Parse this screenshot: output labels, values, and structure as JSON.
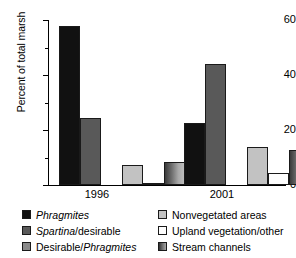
{
  "chart_data": {
    "type": "bar",
    "title": "",
    "xlabel": "",
    "ylabel": "Percent of total marsh",
    "ylim": [
      0,
      60
    ],
    "yticks": [
      0,
      20,
      40,
      60
    ],
    "ytick_labels": [
      "0",
      "20",
      "40",
      "60"
    ],
    "minor_yticks": [
      10,
      30,
      50
    ],
    "grid": false,
    "legend_position": "below-plot-two-columns",
    "categories": [
      "1996",
      "2001"
    ],
    "series": [
      {
        "name": "Phragmites",
        "label_italic": "Phragmites",
        "color": "#111111",
        "values": [
          57.8,
          22.5
        ]
      },
      {
        "name": "Spartina/desirable",
        "label_italic": "Spartina",
        "label_rest": "/desirable",
        "color": "#595959",
        "values": [
          24.4,
          44.0
        ]
      },
      {
        "name": "Desirable/Phragmites",
        "label_rest": "Desirable/",
        "label_italic": "Phragmites",
        "color": "#8a8a8a",
        "values": [
          0.0,
          0.0
        ]
      },
      {
        "name": "Nonvegetated areas",
        "color": "#c2c2c2",
        "values": [
          7.3,
          13.8
        ]
      },
      {
        "name": "Upland vegetation/other",
        "color": "#fdfdfd",
        "values": [
          0.7,
          4.4
        ]
      },
      {
        "name": "Stream channels",
        "color": "#7e7e7e",
        "gradient": true,
        "values": [
          8.4,
          12.7
        ]
      }
    ]
  },
  "axis": {
    "y_label": "Percent of total marsh",
    "tick_60": "60",
    "tick_40": "40",
    "tick_20": "20",
    "tick_0": "0",
    "group_1996": "1996",
    "group_2001": "2001"
  },
  "legend": {
    "items": [
      {
        "text": "Phragmites",
        "italic_part": "Phragmites",
        "plain_part": ""
      },
      {
        "text": "Spartina/desirable",
        "italic_part": "Spartina",
        "plain_part": "/desirable"
      },
      {
        "text": "Desirable/Phragmites",
        "italic_part": "Phragmites",
        "plain_part": "Desirable/"
      },
      {
        "text": "Nonvegetated areas",
        "italic_part": "",
        "plain_part": "Nonvegetated areas"
      },
      {
        "text": "Upland vegetation/other",
        "italic_part": "",
        "plain_part": "Upland vegetation/other"
      },
      {
        "text": "Stream channels",
        "italic_part": "",
        "plain_part": "Stream channels"
      }
    ]
  },
  "colors": {
    "phragmites": "#111111",
    "spartina_desirable": "#595959",
    "desirable_phragmites": "#8a8a8a",
    "nonvegetated": "#c2c2c2",
    "upland": "#fdfdfd",
    "stream": "#7e7e7e",
    "axis": "#000000",
    "background": "#ffffff"
  }
}
